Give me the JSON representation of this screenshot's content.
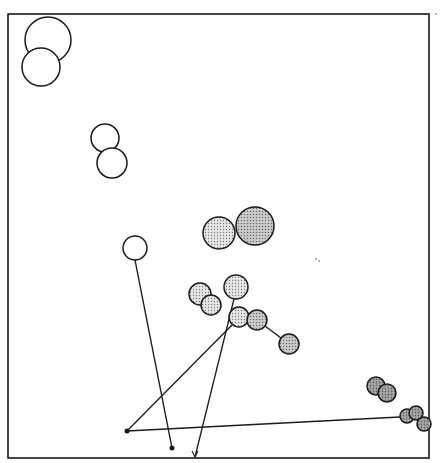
{
  "diagram": {
    "type": "bubble-link-diagram",
    "frame": {
      "x": 8,
      "y": 14,
      "width": 421,
      "height": 444,
      "stroke": "#1a1a1a"
    },
    "colors": {
      "open": "#ffffff",
      "light_dotted": "#cfcfcf",
      "medium_gray": "#b9b9b9",
      "dark_gray": "#9a9a9a",
      "stroke": "#1a1a1a"
    },
    "circles": [
      {
        "id": "c1",
        "cx": 48,
        "cy": 40,
        "r": 23,
        "fill": "open"
      },
      {
        "id": "c2",
        "cx": 41,
        "cy": 67,
        "r": 19,
        "fill": "open"
      },
      {
        "id": "c3",
        "cx": 105,
        "cy": 138,
        "r": 14,
        "fill": "open"
      },
      {
        "id": "c4",
        "cx": 112,
        "cy": 163,
        "r": 15,
        "fill": "open"
      },
      {
        "id": "c5",
        "cx": 219,
        "cy": 233,
        "r": 16,
        "fill": "light_dotted"
      },
      {
        "id": "c6",
        "cx": 255,
        "cy": 226,
        "r": 19,
        "fill": "medium_gray"
      },
      {
        "id": "c7",
        "cx": 135,
        "cy": 248,
        "r": 12,
        "fill": "open"
      },
      {
        "id": "c8",
        "cx": 200,
        "cy": 294,
        "r": 11,
        "fill": "light_dotted"
      },
      {
        "id": "c9",
        "cx": 211,
        "cy": 305,
        "r": 10,
        "fill": "light_dotted"
      },
      {
        "id": "c10",
        "cx": 236,
        "cy": 287,
        "r": 12,
        "fill": "light_dotted"
      },
      {
        "id": "c11",
        "cx": 239,
        "cy": 317,
        "r": 10,
        "fill": "light_dotted"
      },
      {
        "id": "c12",
        "cx": 257,
        "cy": 320,
        "r": 10,
        "fill": "medium_gray"
      },
      {
        "id": "c13",
        "cx": 289,
        "cy": 344,
        "r": 10,
        "fill": "medium_gray"
      },
      {
        "id": "c14",
        "cx": 376,
        "cy": 386,
        "r": 9,
        "fill": "dark_gray"
      },
      {
        "id": "c15",
        "cx": 387,
        "cy": 393,
        "r": 9,
        "fill": "dark_gray"
      },
      {
        "id": "c16",
        "cx": 407,
        "cy": 416,
        "r": 7,
        "fill": "dark_gray"
      },
      {
        "id": "c17",
        "cx": 416,
        "cy": 413,
        "r": 7,
        "fill": "dark_gray"
      },
      {
        "id": "c18",
        "cx": 424,
        "cy": 424,
        "r": 7,
        "fill": "dark_gray"
      }
    ],
    "lines": [
      {
        "id": "l1",
        "x1": 135,
        "y1": 260,
        "x2": 172,
        "y2": 448
      },
      {
        "id": "l2",
        "x1": 234,
        "y1": 299,
        "x2": 195,
        "y2": 457
      },
      {
        "id": "l3",
        "x1": 233,
        "y1": 324,
        "x2": 127,
        "y2": 431
      },
      {
        "id": "l4",
        "x1": 127,
        "y1": 431,
        "x2": 400,
        "y2": 417
      },
      {
        "id": "l5",
        "x1": 265,
        "y1": 326,
        "x2": 281,
        "y2": 338
      }
    ],
    "dots": [
      {
        "id": "d1",
        "cx": 127,
        "cy": 431,
        "r": 2.5
      },
      {
        "id": "d2",
        "cx": 172,
        "cy": 448,
        "r": 2.5
      }
    ],
    "arrows": [
      {
        "id": "a1",
        "x": 195,
        "y": 457
      }
    ],
    "specks": [
      {
        "cx": 316,
        "cy": 259
      },
      {
        "cx": 319,
        "cy": 261
      },
      {
        "cx": 436,
        "cy": 14
      }
    ]
  }
}
